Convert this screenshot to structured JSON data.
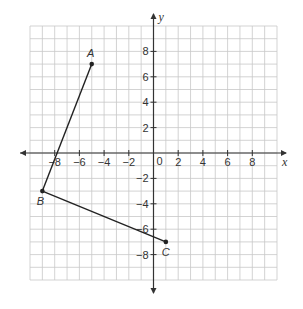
{
  "chart_data": {
    "type": "scatter",
    "title": "",
    "xlabel": "x",
    "ylabel": "y",
    "xlim": [
      -10,
      10
    ],
    "ylim": [
      -10,
      10
    ],
    "grid": true,
    "x_ticks": [
      -8,
      -6,
      -4,
      -2,
      2,
      4,
      6,
      8
    ],
    "y_ticks": [
      8,
      6,
      4,
      2,
      -2,
      -4,
      -6,
      -8
    ],
    "x_tick_labels": [
      "−8",
      "−6",
      "−4",
      "−2",
      "2",
      "4",
      "6",
      "8"
    ],
    "y_tick_labels": [
      "8",
      "6",
      "4",
      "2",
      "−2",
      "−4",
      "−6",
      "−8"
    ],
    "origin_label": "0",
    "points": [
      {
        "name": "A",
        "x": -5,
        "y": 7
      },
      {
        "name": "B",
        "x": -9,
        "y": -3
      },
      {
        "name": "C",
        "x": 1,
        "y": -7
      }
    ],
    "segments": [
      {
        "from": "A",
        "to": "B"
      },
      {
        "from": "B",
        "to": "C"
      }
    ]
  }
}
